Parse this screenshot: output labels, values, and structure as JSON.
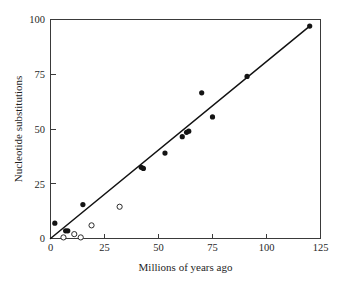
{
  "chart_data": {
    "type": "scatter",
    "title": "",
    "xlabel": "Millions of years ago",
    "ylabel": "Nucleotide substitutions",
    "xlim": [
      0,
      125
    ],
    "ylim": [
      0,
      100
    ],
    "xticks": [
      0,
      25,
      50,
      75,
      100,
      125
    ],
    "yticks": [
      0,
      25,
      50,
      75,
      100
    ],
    "xtick_labels": [
      "0",
      "25",
      "50",
      "75",
      "100",
      "125"
    ],
    "ytick_labels": [
      "0",
      "25",
      "50",
      "75",
      "100"
    ],
    "grid": false,
    "legend": "none",
    "frame": "box",
    "series": [
      {
        "name": "filled-circles",
        "marker": "filled-circle",
        "color": "#141414",
        "points": [
          {
            "x": 2,
            "y": 7
          },
          {
            "x": 7,
            "y": 3.5
          },
          {
            "x": 8,
            "y": 3.5
          },
          {
            "x": 15,
            "y": 15.5
          },
          {
            "x": 42,
            "y": 32.5
          },
          {
            "x": 43,
            "y": 32
          },
          {
            "x": 53,
            "y": 39
          },
          {
            "x": 61,
            "y": 46.5
          },
          {
            "x": 63,
            "y": 48.5
          },
          {
            "x": 64,
            "y": 49
          },
          {
            "x": 70,
            "y": 66.5
          },
          {
            "x": 75,
            "y": 55.5
          },
          {
            "x": 91,
            "y": 74
          },
          {
            "x": 120,
            "y": 97
          }
        ]
      },
      {
        "name": "open-circles",
        "marker": "open-circle",
        "color": "#2b2b2b",
        "points": [
          {
            "x": 6,
            "y": 0.5
          },
          {
            "x": 11,
            "y": 2
          },
          {
            "x": 14,
            "y": 0.5
          },
          {
            "x": 19,
            "y": 6
          },
          {
            "x": 32,
            "y": 14.5
          }
        ]
      }
    ],
    "fit_line": {
      "name": "regression-line",
      "x0": 0,
      "y0": 0,
      "x1": 120,
      "y1": 97,
      "color": "#121212"
    }
  }
}
